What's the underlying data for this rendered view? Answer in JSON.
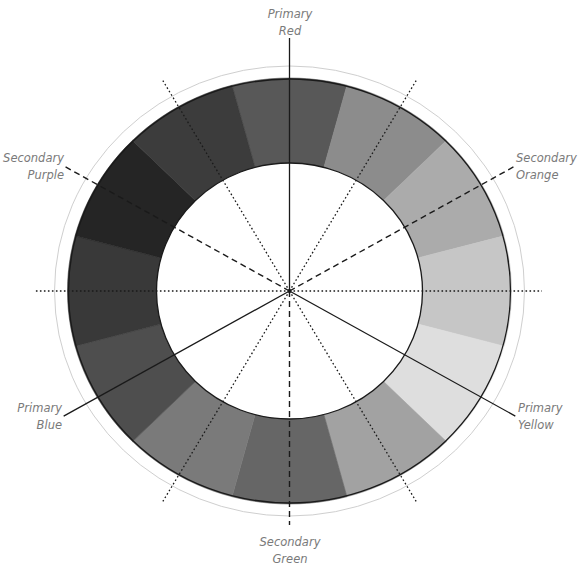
{
  "diagram": {
    "type": "color-wheel",
    "segment_count": 12,
    "segments": [
      {
        "angle_deg": 0,
        "name": "Red",
        "shade": "#585858"
      },
      {
        "angle_deg": 30,
        "name": "Red-Orange",
        "shade": "#8c8c8c"
      },
      {
        "angle_deg": 60,
        "name": "Orange",
        "shade": "#ababab"
      },
      {
        "angle_deg": 90,
        "name": "Yellow-Orange",
        "shade": "#c6c6c6"
      },
      {
        "angle_deg": 120,
        "name": "Yellow",
        "shade": "#dedede"
      },
      {
        "angle_deg": 150,
        "name": "Yellow-Green",
        "shade": "#a2a2a2"
      },
      {
        "angle_deg": 180,
        "name": "Green",
        "shade": "#666666"
      },
      {
        "angle_deg": 210,
        "name": "Blue-Green",
        "shade": "#7a7a7a"
      },
      {
        "angle_deg": 240,
        "name": "Blue",
        "shade": "#4e4e4e"
      },
      {
        "angle_deg": 270,
        "name": "Blue-Purple",
        "shade": "#393939"
      },
      {
        "angle_deg": 300,
        "name": "Purple",
        "shade": "#252525"
      },
      {
        "angle_deg": 330,
        "name": "Red-Purple",
        "shade": "#3c3c3c"
      }
    ],
    "axes": [
      {
        "angle_deg": 0,
        "style": "solid",
        "role": "primary"
      },
      {
        "angle_deg": 120,
        "style": "solid",
        "role": "primary"
      },
      {
        "angle_deg": 240,
        "style": "solid",
        "role": "primary"
      },
      {
        "angle_deg": 60,
        "style": "dashed",
        "role": "secondary"
      },
      {
        "angle_deg": 180,
        "style": "dashed",
        "role": "secondary"
      },
      {
        "angle_deg": 300,
        "style": "dashed",
        "role": "secondary"
      },
      {
        "angle_deg": 30,
        "style": "dotted",
        "role": "tertiary"
      },
      {
        "angle_deg": 90,
        "style": "dotted",
        "role": "tertiary"
      },
      {
        "angle_deg": 150,
        "style": "dotted",
        "role": "tertiary"
      },
      {
        "angle_deg": 210,
        "style": "dotted",
        "role": "tertiary"
      },
      {
        "angle_deg": 270,
        "style": "dotted",
        "role": "tertiary"
      },
      {
        "angle_deg": 330,
        "style": "dotted",
        "role": "tertiary"
      }
    ],
    "labels": {
      "primary_red": {
        "line1": "Primary",
        "line2": "Red"
      },
      "secondary_orange": {
        "line1": "Secondary",
        "line2": "Orange"
      },
      "primary_yellow": {
        "line1": "Primary",
        "line2": "Yellow"
      },
      "secondary_green": {
        "line1": "Secondary",
        "line2": "Green"
      },
      "primary_blue": {
        "line1": "Primary",
        "line2": "Blue"
      },
      "secondary_purple": {
        "line1": "Secondary",
        "line2": "Purple"
      }
    },
    "colors": {
      "outline": "#1a1a1a",
      "outer_ring": "#cfcfcf",
      "center_fill": "#ffffff",
      "line": "#1a1a1a",
      "label_text": "#7a7a7a"
    }
  }
}
